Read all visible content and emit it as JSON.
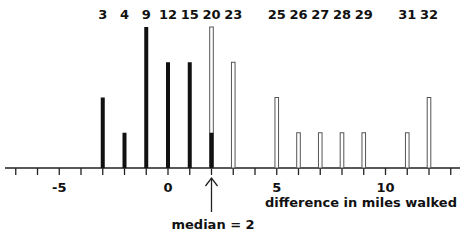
{
  "chart_data": {
    "type": "bar",
    "title": "",
    "xlabel": "difference in miles walked",
    "ylabel": "",
    "xlim": [
      -8,
      12.6
    ],
    "x_ticks": [
      -8,
      -7,
      -6,
      -5,
      -4,
      -3,
      -2,
      -1,
      0,
      1,
      2,
      3,
      4,
      5,
      6,
      7,
      8,
      9,
      10,
      11,
      12,
      13
    ],
    "x_tick_labels": [
      {
        "x": -5,
        "label": "-5"
      },
      {
        "x": 0,
        "label": "0"
      },
      {
        "x": 5,
        "label": "5"
      },
      {
        "x": 10,
        "label": "10"
      }
    ],
    "grid": false,
    "bars": [
      {
        "x": -8,
        "count": 1,
        "style": "solid",
        "top_label": "1"
      },
      {
        "x": -3,
        "count": 2,
        "style": "solid",
        "top_label": "3"
      },
      {
        "x": -2,
        "count": 1,
        "style": "solid",
        "top_label": "4"
      },
      {
        "x": -1,
        "count": 4,
        "style": "solid",
        "top_label": "9"
      },
      {
        "x": 0,
        "count": 3,
        "style": "solid",
        "top_label": "12"
      },
      {
        "x": 1,
        "count": 3,
        "style": "solid",
        "top_label": "15"
      },
      {
        "x": 2,
        "count": 4,
        "solid_part": 1,
        "style": "split",
        "top_label": "20"
      },
      {
        "x": 3,
        "count": 3,
        "style": "hollow",
        "top_label": "23"
      },
      {
        "x": 5,
        "count": 2,
        "style": "hollow",
        "top_label": "25"
      },
      {
        "x": 6,
        "count": 1,
        "style": "hollow",
        "top_label": "26"
      },
      {
        "x": 7,
        "count": 1,
        "style": "hollow",
        "top_label": "27"
      },
      {
        "x": 8,
        "count": 1,
        "style": "hollow",
        "top_label": "28"
      },
      {
        "x": 9,
        "count": 1,
        "style": "hollow",
        "top_label": "29"
      },
      {
        "x": 11,
        "count": 1,
        "style": "hollow",
        "top_label": "31"
      },
      {
        "x": 12,
        "count": 2,
        "style": "hollow",
        "top_label": "32"
      }
    ],
    "annotations": [
      {
        "x": 2,
        "text": "median = 2",
        "type": "arrow-up"
      }
    ]
  },
  "colors": {
    "solid": "#111111",
    "hollow_fill": "#ffffff",
    "hollow_stroke": "#555555",
    "axis": "#222222"
  }
}
